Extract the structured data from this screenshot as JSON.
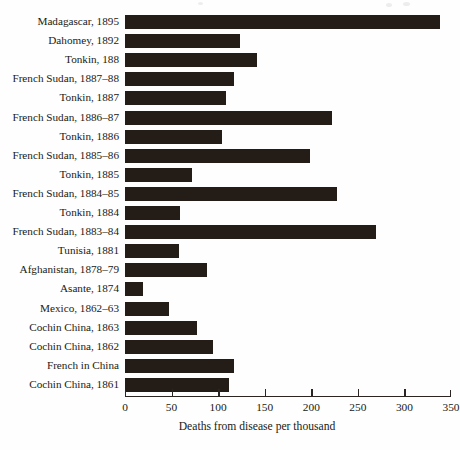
{
  "chart_data": {
    "type": "bar",
    "orientation": "horizontal",
    "title": "",
    "xlabel": "Deaths from disease per thousand",
    "ylabel": "",
    "xlim": [
      0,
      350
    ],
    "xticks": [
      0,
      50,
      100,
      150,
      200,
      250,
      300,
      350
    ],
    "ticklabels": [
      "0",
      "50",
      "100",
      "150",
      "200",
      "250",
      "300",
      "350"
    ],
    "grid": false,
    "legend": false,
    "bar_color": "#241d17",
    "background_color": "#fefefe",
    "categories": [
      "Madagascar, 1895",
      "Dahomey, 1892",
      "Tonkin, 188",
      "French Sudan, 1887–88",
      "Tonkin, 1887",
      "French Sudan, 1886–87",
      "Tonkin, 1886",
      "French Sudan, 1885–86",
      "Tonkin, 1885",
      "French Sudan, 1884–85",
      "Tonkin, 1884",
      "French Sudan, 1883–84",
      "Tunisia, 1881",
      "Afghanistan, 1878–79",
      "Asante, 1874",
      "Mexico, 1862–63",
      "Cochin China, 1863",
      "Cochin China, 1862",
      "French in China",
      "Cochin China, 1861"
    ],
    "values": [
      338,
      123,
      142,
      117,
      108,
      222,
      104,
      199,
      72,
      228,
      59,
      270,
      58,
      88,
      19,
      47,
      77,
      94,
      117,
      112
    ]
  }
}
